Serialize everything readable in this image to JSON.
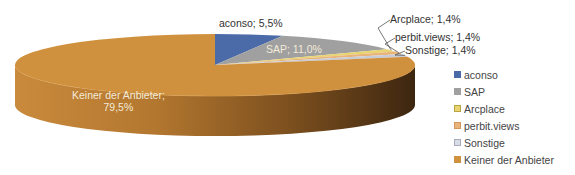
{
  "chart_data": {
    "type": "pie",
    "subtype": "3d-pie",
    "title": "",
    "categories": [
      "aconso",
      "SAP",
      "Arcplace",
      "perbit.views",
      "Sonstige",
      "Keiner der Anbieter"
    ],
    "values": [
      5.5,
      11.0,
      1.4,
      1.4,
      1.4,
      79.5
    ],
    "unit": "%",
    "colors": [
      "#4a6aa8",
      "#a0a0a0",
      "#e8d470",
      "#e8b47a",
      "#c8ccd6",
      "#d0913e"
    ],
    "data_labels": [
      "aconso; 5,5%",
      "SAP; 11,0%",
      "Arcplace; 1,4%",
      "perbit.views; 1,4%",
      "Sonstige; 1,4%",
      "Keiner der Anbieter; 79,5%"
    ],
    "legend_position": "right",
    "grid": false
  },
  "labels": {
    "aconso": "aconso; 5,5%",
    "sap": "SAP; 11,0%",
    "arcplace": "Arcplace; 1,4%",
    "perbit": "perbit.views; 1,4%",
    "sonstige": "Sonstige; 1,4%",
    "keiner_line1": "Keiner der Anbieter;",
    "keiner_line2": "79,5%"
  },
  "legend": {
    "items": [
      {
        "label": "aconso",
        "color": "#4a6aa8"
      },
      {
        "label": "SAP",
        "color": "#a0a0a0"
      },
      {
        "label": "Arcplace",
        "color": "#e8d470"
      },
      {
        "label": "perbit.views",
        "color": "#e8b47a"
      },
      {
        "label": "Sonstige",
        "color": "#c8ccd6"
      },
      {
        "label": "Keiner der Anbieter",
        "color": "#d0913e"
      }
    ]
  }
}
